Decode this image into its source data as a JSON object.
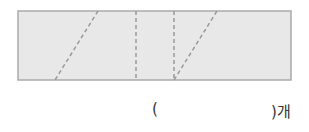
{
  "figure": {
    "shape": "rectangle",
    "fill": "#e8e8e8",
    "stroke": "#aaaaaa",
    "dash_color": "#999999",
    "rect": {
      "x": 18,
      "y": 11,
      "width": 273,
      "height": 69
    },
    "dashed_lines": [
      {
        "type": "diagonal",
        "x1": 98,
        "y1": 11,
        "x2": 55,
        "y2": 80
      },
      {
        "type": "vertical",
        "x1": 136,
        "y1": 11,
        "x2": 136,
        "y2": 80
      },
      {
        "type": "vertical",
        "x1": 174,
        "y1": 11,
        "x2": 174,
        "y2": 80
      },
      {
        "type": "diagonal",
        "x1": 174,
        "y1": 80,
        "x2": 217,
        "y2": 11
      }
    ]
  },
  "answer": {
    "open_paren": "(",
    "close_paren": ")",
    "unit": "개",
    "value": ""
  }
}
